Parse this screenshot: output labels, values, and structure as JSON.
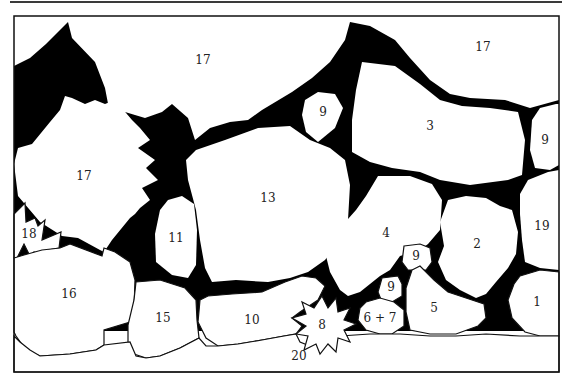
{
  "diagram": {
    "type": "numbered planting plan (stone wall with plant pockets)",
    "colors": {
      "background": "#ffffff",
      "fill_dark": "#000000",
      "stroke": "#111111"
    },
    "regions": [
      {
        "id": "r17a",
        "label": "17",
        "x": 203,
        "y": 60
      },
      {
        "id": "r17b",
        "label": "17",
        "x": 483,
        "y": 47
      },
      {
        "id": "r17c",
        "label": "17",
        "x": 84,
        "y": 176
      },
      {
        "id": "r9a",
        "label": "9",
        "x": 323,
        "y": 112
      },
      {
        "id": "r3",
        "label": "3",
        "x": 430,
        "y": 126
      },
      {
        "id": "r9b",
        "label": "9",
        "x": 545,
        "y": 140
      },
      {
        "id": "r13",
        "label": "13",
        "x": 268,
        "y": 198
      },
      {
        "id": "r11",
        "label": "11",
        "x": 176,
        "y": 238
      },
      {
        "id": "r18",
        "label": "18",
        "x": 29,
        "y": 234
      },
      {
        "id": "r4",
        "label": "4",
        "x": 386,
        "y": 233
      },
      {
        "id": "r9c",
        "label": "9",
        "x": 416,
        "y": 256
      },
      {
        "id": "r2",
        "label": "2",
        "x": 477,
        "y": 244
      },
      {
        "id": "r19",
        "label": "19",
        "x": 542,
        "y": 226
      },
      {
        "id": "r16",
        "label": "16",
        "x": 69,
        "y": 294
      },
      {
        "id": "r9d",
        "label": "9",
        "x": 391,
        "y": 287
      },
      {
        "id": "r15",
        "label": "15",
        "x": 163,
        "y": 318
      },
      {
        "id": "r10",
        "label": "10",
        "x": 252,
        "y": 320
      },
      {
        "id": "r8",
        "label": "8",
        "x": 322,
        "y": 325
      },
      {
        "id": "r6-7",
        "label": "6 + 7",
        "x": 380,
        "y": 318
      },
      {
        "id": "r5",
        "label": "5",
        "x": 434,
        "y": 308
      },
      {
        "id": "r1",
        "label": "1",
        "x": 537,
        "y": 302
      },
      {
        "id": "r20",
        "label": "20",
        "x": 299,
        "y": 356
      }
    ]
  }
}
